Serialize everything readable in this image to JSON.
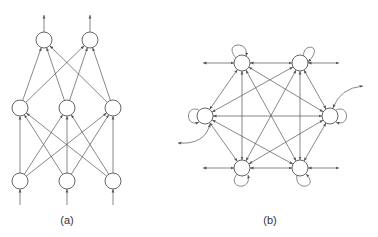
{
  "figure": {
    "panels": [
      {
        "id": "a",
        "label": "(a)",
        "type": "feedforward-network",
        "layers": [
          {
            "name": "input",
            "nodes": [
              [
                20,
                181
              ],
              [
                67,
                181
              ],
              [
                113,
                181
              ]
            ]
          },
          {
            "name": "hidden",
            "nodes": [
              [
                20,
                108
              ],
              [
                67,
                108
              ],
              [
                113,
                108
              ]
            ]
          },
          {
            "name": "output",
            "nodes": [
              [
                44,
                40
              ],
              [
                90,
                40
              ]
            ]
          }
        ]
      },
      {
        "id": "b",
        "label": "(b)",
        "type": "recurrent-network",
        "nodes": [
          [
            242,
            63
          ],
          [
            300,
            63
          ],
          [
            205,
            116
          ],
          [
            330,
            116
          ],
          [
            242,
            168
          ],
          [
            300,
            168
          ]
        ]
      }
    ],
    "colors": {
      "stroke": "#555555",
      "node_fill": "#ffffff",
      "text": "#333333"
    }
  }
}
